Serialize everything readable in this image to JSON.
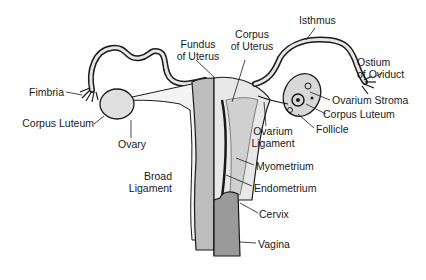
{
  "diagram": {
    "labels": {
      "fimbria": "Fimbria",
      "corpus_luteum_left": "Corpus Luteum",
      "ovary": "Ovary",
      "fundus_line1": "Fundus",
      "fundus_line2": "of Uterus",
      "corpus_uterus_line1": "Corpus",
      "corpus_uterus_line2": "of Uterus",
      "isthmus": "Isthmus",
      "ostium_line1": "Ostium",
      "ostium_line2": "of Oviduct",
      "ovarium_stroma": "Ovarium Stroma",
      "corpus_luteum_right": "Corpus Luteum",
      "follicle": "Follicle",
      "ovarium_ligament_line1": "Ovarium",
      "ovarium_ligament_line2": "Ligament",
      "broad_ligament_line1": "Broad",
      "broad_ligament_line2": "Ligament",
      "myometrium": "Myometrium",
      "endometrium": "Endometrium",
      "cervix": "Cervix",
      "vagina": "Vagina"
    },
    "colors": {
      "line": "#1a1a1a",
      "fill_light": "#e6e6e6",
      "fill_mid": "#c8c8c8",
      "fill_dark": "#9a9a9a"
    }
  }
}
